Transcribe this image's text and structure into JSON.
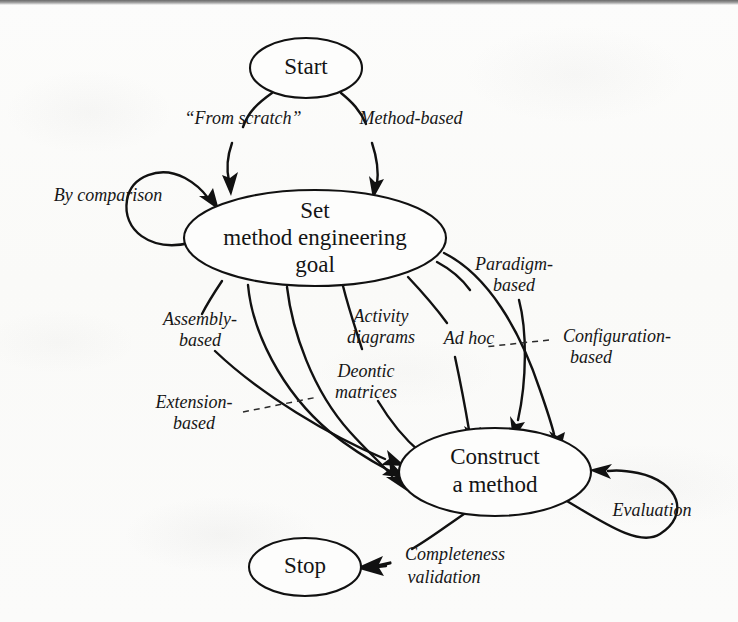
{
  "diagram": {
    "type": "flowchart",
    "background_color": "#fbfbfa",
    "stroke_color": "#111111",
    "nodes": [
      {
        "id": "start",
        "label": "Start",
        "cx": 306,
        "cy": 68,
        "rx": 56,
        "ry": 30
      },
      {
        "id": "setgoal",
        "label_line1": "Set",
        "label_line2": "method engineering",
        "label_line3": "goal",
        "cx": 315,
        "cy": 238,
        "rx": 131,
        "ry": 48
      },
      {
        "id": "construct",
        "label_line1": "Construct",
        "label_line2": "a method",
        "cx": 495,
        "cy": 472,
        "rx": 96,
        "ry": 44
      },
      {
        "id": "stop",
        "label": "Stop",
        "cx": 305,
        "cy": 567,
        "rx": 56,
        "ry": 29
      }
    ],
    "edge_labels": [
      {
        "id": "from-scratch",
        "text": "“From scratch”",
        "x": 243,
        "y": 120,
        "anchor": "middle"
      },
      {
        "id": "method-based",
        "text": "Method-based",
        "x": 411,
        "y": 120,
        "anchor": "middle"
      },
      {
        "id": "by-comparison",
        "text": "By comparison",
        "x": 108,
        "y": 197,
        "anchor": "middle"
      },
      {
        "id": "assembly-based-1",
        "text": "Assembly-",
        "x": 200,
        "y": 321,
        "anchor": "middle"
      },
      {
        "id": "assembly-based-2",
        "text": "based",
        "x": 200,
        "y": 342,
        "anchor": "middle"
      },
      {
        "id": "extension-based-1",
        "text": "Extension-",
        "x": 194,
        "y": 404,
        "anchor": "middle"
      },
      {
        "id": "extension-based-2",
        "text": "based",
        "x": 194,
        "y": 425,
        "anchor": "middle"
      },
      {
        "id": "deontic-matrices-1",
        "text": "Deontic",
        "x": 366,
        "y": 373,
        "anchor": "middle"
      },
      {
        "id": "deontic-matrices-2",
        "text": "matrices",
        "x": 366,
        "y": 394,
        "anchor": "middle"
      },
      {
        "id": "activity-diagrams-1",
        "text": "Activity",
        "x": 381,
        "y": 318,
        "anchor": "middle"
      },
      {
        "id": "activity-diagrams-2",
        "text": "diagrams",
        "x": 381,
        "y": 339,
        "anchor": "middle"
      },
      {
        "id": "ad-hoc",
        "text": "Ad hoc",
        "x": 469,
        "y": 340,
        "anchor": "middle"
      },
      {
        "id": "paradigm-based-1",
        "text": "Paradigm-",
        "x": 514,
        "y": 266,
        "anchor": "middle"
      },
      {
        "id": "paradigm-based-2",
        "text": "based",
        "x": 514,
        "y": 287,
        "anchor": "middle"
      },
      {
        "id": "configuration-1",
        "text": "Configuration-",
        "x": 617,
        "y": 338,
        "anchor": "middle"
      },
      {
        "id": "configuration-2",
        "text": "based",
        "x": 591,
        "y": 359,
        "anchor": "middle"
      },
      {
        "id": "evaluation",
        "text": "Evaluation",
        "x": 652,
        "y": 512,
        "anchor": "middle"
      },
      {
        "id": "completeness-1",
        "text": "Completeness",
        "x": 455,
        "y": 556,
        "anchor": "middle"
      },
      {
        "id": "validation-2",
        "text": "validation",
        "x": 444,
        "y": 579,
        "anchor": "middle"
      }
    ],
    "edges": [
      {
        "id": "start-to-setgoal-scratch",
        "from": "start",
        "to": "setgoal",
        "label": "“From scratch”"
      },
      {
        "id": "start-to-setgoal-method",
        "from": "start",
        "to": "setgoal",
        "label": "Method-based"
      },
      {
        "id": "setgoal-self-comparison",
        "from": "setgoal",
        "to": "setgoal",
        "label": "By comparison"
      },
      {
        "id": "setgoal-to-construct-assembly",
        "from": "setgoal",
        "to": "construct",
        "label": "Assembly-based"
      },
      {
        "id": "setgoal-to-construct-extension",
        "from": "setgoal",
        "to": "construct",
        "label": "Extension-based"
      },
      {
        "id": "setgoal-to-construct-deontic",
        "from": "setgoal",
        "to": "construct",
        "label": "Deontic matrices"
      },
      {
        "id": "setgoal-to-construct-activity",
        "from": "setgoal",
        "to": "construct",
        "label": "Activity diagrams"
      },
      {
        "id": "setgoal-to-construct-adhoc",
        "from": "setgoal",
        "to": "construct",
        "label": "Ad hoc"
      },
      {
        "id": "setgoal-to-construct-paradigm",
        "from": "setgoal",
        "to": "construct",
        "label": "Paradigm-based"
      },
      {
        "id": "setgoal-to-construct-configuration",
        "from": "setgoal",
        "to": "construct",
        "label": "Configuration-based"
      },
      {
        "id": "construct-self-evaluation",
        "from": "construct",
        "to": "construct",
        "label": "Evaluation"
      },
      {
        "id": "construct-to-stop",
        "from": "construct",
        "to": "stop",
        "label": "Completeness validation"
      }
    ]
  }
}
